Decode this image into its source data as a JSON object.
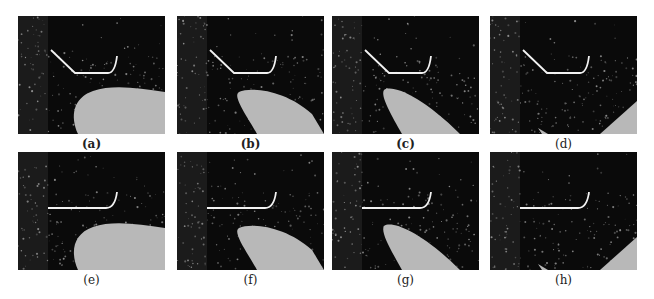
{
  "figure": {
    "panels": [
      {
        "id": "a",
        "label": "(a)",
        "blade_visible": true,
        "shape": "bent",
        "blade": "big"
      },
      {
        "id": "b",
        "label": "(b)",
        "blade_visible": true,
        "shape": "bent",
        "blade": "mid"
      },
      {
        "id": "c",
        "label": "(c)",
        "blade_visible": true,
        "shape": "bent",
        "blade": "narrow"
      },
      {
        "id": "d",
        "label": "(d)",
        "blade_visible": false,
        "shape": "bent",
        "blade": "edge"
      },
      {
        "id": "e",
        "label": "(e)",
        "blade_visible": true,
        "shape": "flat",
        "blade": "big"
      },
      {
        "id": "f",
        "label": "(f)",
        "blade_visible": true,
        "shape": "flat",
        "blade": "mid"
      },
      {
        "id": "g",
        "label": "(g)",
        "blade_visible": true,
        "shape": "flat",
        "blade": "narrow"
      },
      {
        "id": "h",
        "label": "(h)",
        "blade_visible": false,
        "shape": "flat",
        "blade": "edge"
      }
    ],
    "colors": {
      "background": "#0a0a0a",
      "blade": "#b8b8b8",
      "plate": "#f2f2f2",
      "particles": "#9a9a9a"
    }
  }
}
